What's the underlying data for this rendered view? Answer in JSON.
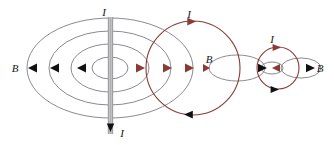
{
  "figure": {
    "background_color": "#ffffff",
    "width": 334,
    "height": 145,
    "colors": {
      "field_line_gray": "#7d7d85",
      "loop_dark_red": "#8a3b36",
      "arrow_black": "#111111",
      "arrow_red": "#8a3b36",
      "wire_gray": "#b9b9bc",
      "wire_edge": "#8e8e92",
      "label_text": "#161616"
    },
    "labels": [
      {
        "name": "label-I-wire-top",
        "text": "I",
        "x": 104,
        "y": 16
      },
      {
        "name": "label-I-wire-bottom",
        "text": "I",
        "x": 122,
        "y": 137
      },
      {
        "name": "label-B-left",
        "text": "B",
        "x": 15,
        "y": 72
      },
      {
        "name": "label-I-big-loop",
        "text": "I",
        "x": 189,
        "y": 18
      },
      {
        "name": "label-B-middle",
        "text": "B",
        "x": 209,
        "y": 63
      },
      {
        "name": "label-I-small-loop",
        "text": "I",
        "x": 272,
        "y": 43
      },
      {
        "name": "label-B-right",
        "text": "B",
        "x": 320,
        "y": 72
      }
    ],
    "wire": {
      "name": "vertical-current-carrying-wire",
      "x": 110,
      "y_top": 17,
      "y_bottom": 134,
      "width": 5,
      "current_direction": "downward"
    },
    "field_ellipses": [
      {
        "name": "field-line-ellipse-1",
        "cx": 110,
        "cy": 68,
        "rx": 18,
        "ry": 11
      },
      {
        "name": "field-line-ellipse-2",
        "cx": 110,
        "cy": 68,
        "rx": 39,
        "ry": 24
      },
      {
        "name": "field-line-ellipse-3",
        "cx": 110,
        "cy": 68,
        "rx": 61,
        "ry": 37
      },
      {
        "name": "field-line-ellipse-4",
        "cx": 110,
        "cy": 68,
        "rx": 83,
        "ry": 50
      }
    ],
    "loops": [
      {
        "name": "current-loop-large",
        "cx": 193,
        "cy": 68,
        "r": 47,
        "current_direction": "clockwise"
      },
      {
        "name": "current-loop-small",
        "cx": 278,
        "cy": 68,
        "r": 21,
        "current_direction": "clockwise"
      }
    ],
    "loop_field_ellipses": [
      {
        "name": "loop-field-ellipse-large",
        "cx": 237,
        "cy": 68,
        "rx": 28,
        "ry": 13
      },
      {
        "name": "loop-field-ellipse-small",
        "cx": 301,
        "cy": 68,
        "rx": 20,
        "ry": 10
      }
    ],
    "arrows": [
      {
        "name": "arrow-B-left-outer",
        "direction": "left",
        "color": "black"
      },
      {
        "name": "arrow-B-left-mid",
        "direction": "left",
        "color": "black"
      },
      {
        "name": "arrow-B-left-inner",
        "direction": "left",
        "color": "black"
      },
      {
        "name": "arrow-B-right-inner",
        "direction": "right",
        "color": "red"
      },
      {
        "name": "arrow-B-right-mid",
        "direction": "right",
        "color": "red"
      },
      {
        "name": "arrow-B-right-outer",
        "direction": "right",
        "color": "red"
      },
      {
        "name": "arrow-loop-large-top",
        "direction": "right",
        "color": "red"
      },
      {
        "name": "arrow-loop-large-bottom",
        "direction": "left",
        "color": "black"
      },
      {
        "name": "arrow-loop-small-top",
        "direction": "right",
        "color": "red"
      },
      {
        "name": "arrow-loop-small-bottom",
        "direction": "right",
        "color": "black"
      },
      {
        "name": "arrow-mid-ellipse-right",
        "direction": "right",
        "color": "black"
      },
      {
        "name": "arrow-small-ellipse-right",
        "direction": "right",
        "color": "black"
      },
      {
        "name": "arrow-small-loop-center",
        "direction": "left",
        "color": "red"
      },
      {
        "name": "arrow-wire-bottom",
        "direction": "down",
        "color": "black"
      }
    ]
  }
}
